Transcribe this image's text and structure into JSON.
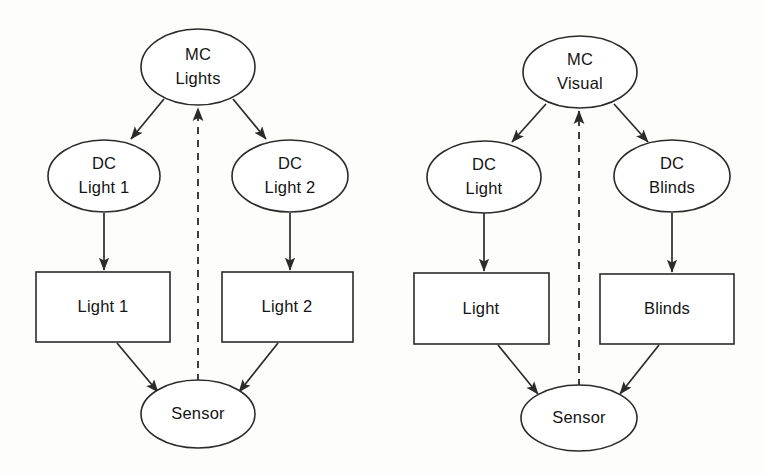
{
  "figure": {
    "background_color": "#fdfdfc",
    "stroke_color": "#2b2b2b",
    "text_color": "#141414",
    "shape_fill": "#ffffff"
  },
  "diagrams": [
    {
      "id": "lights-control",
      "nodes": {
        "mc": {
          "line1": "MC",
          "line2": "Lights",
          "shape": "ellipse"
        },
        "dc_left": {
          "line1": "DC",
          "line2": "Light 1",
          "shape": "ellipse"
        },
        "dc_right": {
          "line1": "DC",
          "line2": "Light 2",
          "shape": "ellipse"
        },
        "device_left": {
          "line1": "Light 1",
          "shape": "rectangle"
        },
        "device_right": {
          "line1": "Light 2",
          "shape": "rectangle"
        },
        "sensor": {
          "line1": "Sensor",
          "shape": "ellipse"
        }
      },
      "edges": [
        {
          "from": "mc",
          "to": "dc_left",
          "style": "solid",
          "arrow": true
        },
        {
          "from": "mc",
          "to": "dc_right",
          "style": "solid",
          "arrow": true
        },
        {
          "from": "dc_left",
          "to": "device_left",
          "style": "solid",
          "arrow": true
        },
        {
          "from": "dc_right",
          "to": "device_right",
          "style": "solid",
          "arrow": true
        },
        {
          "from": "device_left",
          "to": "sensor",
          "style": "solid",
          "arrow": true
        },
        {
          "from": "device_right",
          "to": "sensor",
          "style": "solid",
          "arrow": true
        },
        {
          "from": "sensor",
          "to": "mc",
          "style": "dashed",
          "arrow": true
        }
      ]
    },
    {
      "id": "visual-control",
      "nodes": {
        "mc": {
          "line1": "MC",
          "line2": "Visual",
          "shape": "ellipse"
        },
        "dc_left": {
          "line1": "DC",
          "line2": "Light",
          "shape": "ellipse"
        },
        "dc_right": {
          "line1": "DC",
          "line2": "Blinds",
          "shape": "ellipse"
        },
        "device_left": {
          "line1": "Light",
          "shape": "rectangle"
        },
        "device_right": {
          "line1": "Blinds",
          "shape": "rectangle"
        },
        "sensor": {
          "line1": "Sensor",
          "shape": "ellipse"
        }
      },
      "edges": [
        {
          "from": "mc",
          "to": "dc_left",
          "style": "solid",
          "arrow": true
        },
        {
          "from": "mc",
          "to": "dc_right",
          "style": "solid",
          "arrow": true
        },
        {
          "from": "dc_left",
          "to": "device_left",
          "style": "solid",
          "arrow": true
        },
        {
          "from": "dc_right",
          "to": "device_right",
          "style": "solid",
          "arrow": true
        },
        {
          "from": "device_left",
          "to": "sensor",
          "style": "solid",
          "arrow": true
        },
        {
          "from": "device_right",
          "to": "sensor",
          "style": "solid",
          "arrow": true
        },
        {
          "from": "sensor",
          "to": "mc",
          "style": "dashed",
          "arrow": true
        }
      ]
    }
  ]
}
